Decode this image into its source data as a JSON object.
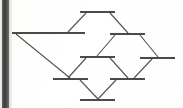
{
  "figure": {
    "kind": "hasse-diagram",
    "alt_label": "Hasse diagram of a lattice with ten elements drawn as horizontal bars",
    "background_color": "#ffffff",
    "line_color": "#55554f",
    "node_color": "#4a4a46",
    "scan_edge_color": "#3c3c3a",
    "width": 183,
    "height": 108
  },
  "chart_data": {
    "type": "diagram",
    "title": "",
    "xlabel": "",
    "ylabel": "",
    "grid": false,
    "legend": "none",
    "xlim": [
      0,
      183
    ],
    "ylim": [
      0,
      108
    ],
    "nodes": [
      {
        "id": "n1",
        "label": "",
        "x1": 80,
        "x2": 115,
        "y": 12,
        "level": 0
      },
      {
        "id": "n2",
        "label": "",
        "x1": 12,
        "x2": 85,
        "y": 33,
        "level": 1
      },
      {
        "id": "n3",
        "label": "",
        "x1": 110,
        "x2": 145,
        "y": 34,
        "level": 1
      },
      {
        "id": "n4",
        "label": "",
        "x1": 80,
        "x2": 115,
        "y": 57,
        "level": 2
      },
      {
        "id": "n5",
        "label": "",
        "x1": 140,
        "x2": 175,
        "y": 58,
        "level": 2
      },
      {
        "id": "n6",
        "label": "",
        "x1": 53,
        "x2": 88,
        "y": 79,
        "level": 3
      },
      {
        "id": "n7",
        "label": "",
        "x1": 110,
        "x2": 145,
        "y": 79,
        "level": 3
      },
      {
        "id": "n8",
        "label": "",
        "x1": 80,
        "x2": 115,
        "y": 100,
        "level": 4
      }
    ],
    "edges": [
      {
        "from": "n1",
        "to": "n2",
        "x1": 86,
        "y1": 13,
        "x2": 68,
        "y2": 32
      },
      {
        "from": "n1",
        "to": "n3",
        "x1": 110,
        "y1": 13,
        "x2": 128,
        "y2": 33
      },
      {
        "from": "n2",
        "to": "n6",
        "x1": 16,
        "y1": 34,
        "x2": 70,
        "y2": 78
      },
      {
        "from": "n3",
        "to": "n4",
        "x1": 115,
        "y1": 35,
        "x2": 97,
        "y2": 56
      },
      {
        "from": "n3",
        "to": "n5",
        "x1": 140,
        "y1": 35,
        "x2": 158,
        "y2": 57
      },
      {
        "from": "n4",
        "to": "n6",
        "x1": 86,
        "y1": 58,
        "x2": 68,
        "y2": 78
      },
      {
        "from": "n4",
        "to": "n7",
        "x1": 110,
        "y1": 58,
        "x2": 128,
        "y2": 78
      },
      {
        "from": "n5",
        "to": "n7",
        "x1": 152,
        "y1": 59,
        "x2": 134,
        "y2": 78
      },
      {
        "from": "n6",
        "to": "n8",
        "x1": 80,
        "y1": 80,
        "x2": 98,
        "y2": 99
      },
      {
        "from": "n7",
        "to": "n8",
        "x1": 116,
        "y1": 80,
        "x2": 98,
        "y2": 99
      }
    ]
  }
}
